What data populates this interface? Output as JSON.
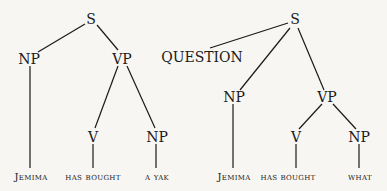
{
  "left_tree": {
    "S": "S",
    "NP": "NP",
    "VP": "VP",
    "V": "V",
    "NP2": "NP",
    "words": {
      "subject": "Jemima",
      "verb": "has bought",
      "object": "a yak"
    }
  },
  "right_tree": {
    "S": "S",
    "QUESTION": "QUESTION",
    "NP": "NP",
    "VP": "VP",
    "V": "V",
    "NP2": "NP",
    "words": {
      "subject": "Jemima",
      "aux": "has",
      "verb": "bought",
      "object": "what"
    }
  },
  "colors": {
    "ink": "#1a1a1a",
    "background": "#f7f6f3"
  }
}
